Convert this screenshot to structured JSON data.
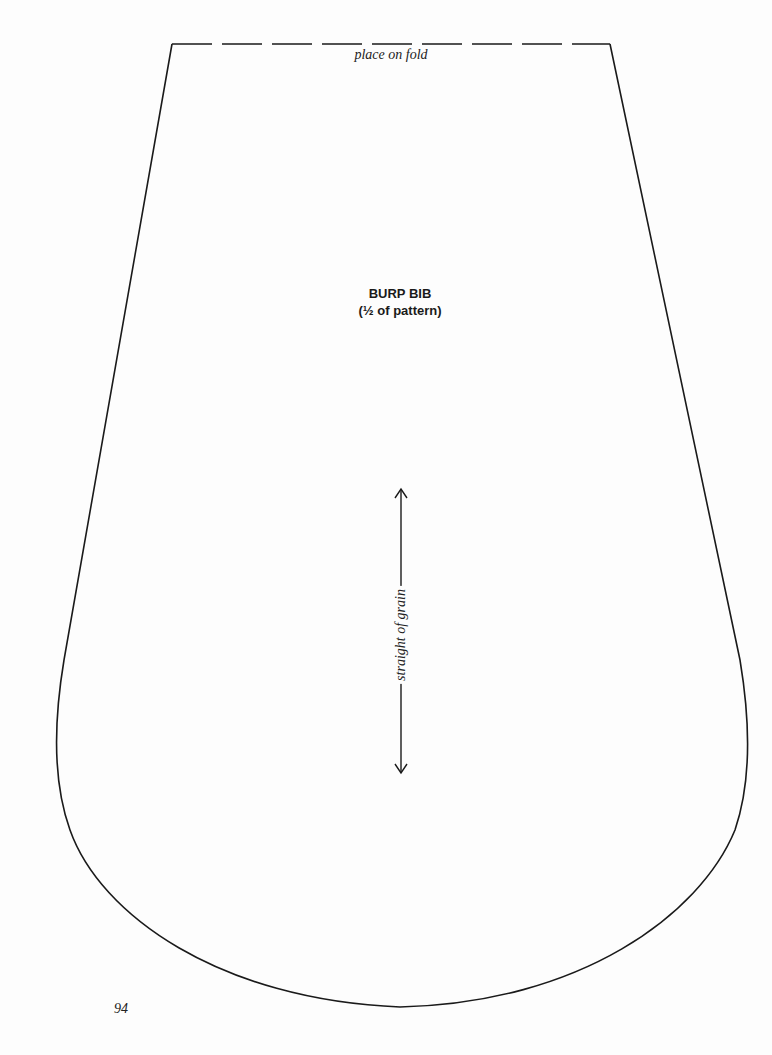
{
  "pattern": {
    "fold_label": "place on fold",
    "title": "BURP BIB",
    "subtitle": "(½ of pattern)",
    "grainline_label": "straight of grain",
    "page_number": "94"
  },
  "colors": {
    "line": "#1a1a1a",
    "paper": "#fdfdfd"
  }
}
